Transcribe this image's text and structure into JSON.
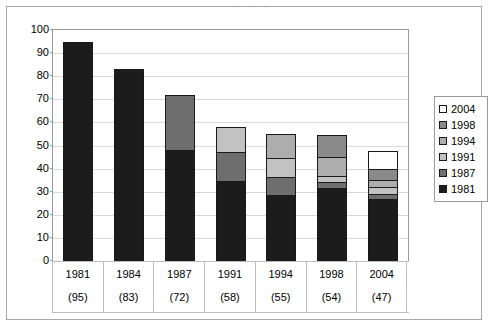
{
  "title_remnant": "· , ·  ,  ·",
  "chart_data": {
    "type": "bar",
    "stacked": true,
    "title": "",
    "xlabel": "",
    "ylabel": "",
    "ylim": [
      0,
      100
    ],
    "ytick_step": 10,
    "yticks": [
      "0",
      "10",
      "20",
      "30",
      "40",
      "50",
      "60",
      "70",
      "80",
      "90",
      "100"
    ],
    "grid": true,
    "legend_position": "right",
    "categories": [
      "1981",
      "1984",
      "1987",
      "1991",
      "1994",
      "1998",
      "2004"
    ],
    "category_sublabels": [
      "(95)",
      "(83)",
      "(72)",
      "(58)",
      "(55)",
      "(54)",
      "(47)"
    ],
    "series": [
      {
        "name": "1981",
        "color": "#1c1c1c",
        "values": [
          95,
          83,
          48,
          34.5,
          28.5,
          31.5,
          27
        ]
      },
      {
        "name": "1987",
        "color": "#6e6e6e",
        "values": [
          0,
          0,
          24,
          12.5,
          8,
          2.5,
          2
        ]
      },
      {
        "name": "1991",
        "color": "#c2c2c2",
        "values": [
          0,
          0,
          0,
          11,
          8,
          3,
          3
        ]
      },
      {
        "name": "1994",
        "color": "#adadad",
        "values": [
          0,
          0,
          0,
          0,
          10.5,
          8,
          3
        ]
      },
      {
        "name": "1998",
        "color": "#8a8a8a",
        "values": [
          0,
          0,
          0,
          0,
          0,
          9.5,
          5
        ]
      },
      {
        "name": "2004",
        "color": "#ffffff",
        "values": [
          0,
          0,
          0,
          0,
          0,
          0,
          7.5
        ]
      }
    ],
    "totals": [
      95,
      83,
      72,
      58,
      55,
      54,
      47.5
    ]
  },
  "legend": {
    "entries": [
      {
        "label": "2004",
        "color": "#ffffff"
      },
      {
        "label": "1998",
        "color": "#8a8a8a"
      },
      {
        "label": "1994",
        "color": "#adadad"
      },
      {
        "label": "1991",
        "color": "#c2c2c2"
      },
      {
        "label": "1987",
        "color": "#6e6e6e"
      },
      {
        "label": "1981",
        "color": "#1c1c1c"
      }
    ]
  },
  "colors": {
    "frame": "#a8a8a8",
    "gridline": "#d9d9d9",
    "axis": "#9a9a9a",
    "bar_outline": "#1a1a1a",
    "text": "#000000",
    "background": "#ffffff"
  }
}
